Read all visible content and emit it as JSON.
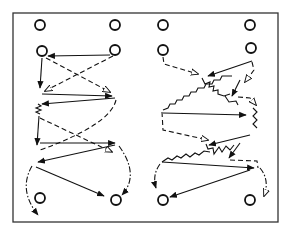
{
  "diagram": {
    "type": "drill-diagram",
    "frame": {
      "x": 13,
      "y": 13,
      "width": 265,
      "height": 209,
      "stroke": "#333333"
    },
    "ink_color": "#111111",
    "background": "#ffffff",
    "left_panel": {
      "players": [
        {
          "id": "L1",
          "x": 40,
          "y": 25
        },
        {
          "id": "L2",
          "x": 115,
          "y": 25
        },
        {
          "id": "L3",
          "x": 42,
          "y": 51
        },
        {
          "id": "L4",
          "x": 115,
          "y": 50
        },
        {
          "id": "L5",
          "x": 40,
          "y": 198
        },
        {
          "id": "L6",
          "x": 116,
          "y": 200
        }
      ]
    },
    "right_panel": {
      "players": [
        {
          "id": "R1",
          "x": 163,
          "y": 25
        },
        {
          "id": "R2",
          "x": 250,
          "y": 25
        },
        {
          "id": "R3",
          "x": 163,
          "y": 50
        },
        {
          "id": "R4",
          "x": 251,
          "y": 48
        },
        {
          "id": "R5",
          "x": 163,
          "y": 200
        },
        {
          "id": "R6",
          "x": 250,
          "y": 200
        }
      ]
    },
    "legend": {
      "solid_arrow": "pass",
      "dashed_arrow": "run without ball",
      "zigzag": "dribble",
      "dash_dot_arrow": "shot / curved run"
    }
  }
}
